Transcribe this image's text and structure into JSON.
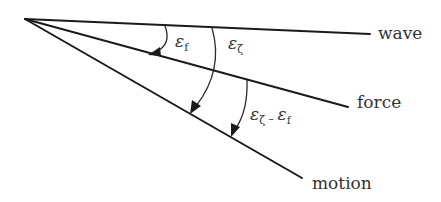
{
  "diagram": {
    "type": "angle-diagram",
    "origin": {
      "x": 25,
      "y": 19
    },
    "rays": [
      {
        "id": "wave",
        "label": "wave",
        "end": {
          "x": 370,
          "y": 34
        },
        "label_pos": {
          "x": 378,
          "y": 39
        }
      },
      {
        "id": "force",
        "label": "force",
        "end": {
          "x": 348,
          "y": 107
        },
        "label_pos": {
          "x": 357,
          "y": 108
        }
      },
      {
        "id": "motion",
        "label": "motion",
        "end": {
          "x": 302,
          "y": 178
        },
        "label_pos": {
          "x": 312,
          "y": 189
        }
      }
    ],
    "angles": [
      {
        "id": "eps-f",
        "symbol": "ε",
        "subscript": "f",
        "from": "wave",
        "to": "force",
        "label_pos": {
          "x": 175,
          "y": 47
        }
      },
      {
        "id": "eps-zeta",
        "symbol": "ε",
        "subscript": "ζ",
        "from": "wave",
        "to": "motion",
        "label_pos": {
          "x": 228,
          "y": 49
        }
      },
      {
        "id": "eps-zeta-minus-eps-f",
        "symbol": "ε",
        "subscript": "ζ",
        "minus": " – ",
        "symbol2": "ε",
        "subscript2": "f",
        "from": "force",
        "to": "motion",
        "label_pos": {
          "x": 250,
          "y": 120
        }
      }
    ],
    "colors": {
      "line": "#1a1a1a",
      "text": "#333333"
    }
  }
}
